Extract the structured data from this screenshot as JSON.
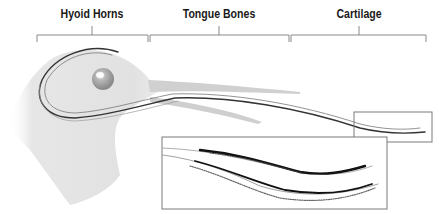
{
  "diagram": {
    "labels": [
      {
        "id": "hyoid-horns",
        "text": "Hyoid Horns",
        "x": 92,
        "bracket": [
          37,
          148
        ]
      },
      {
        "id": "tongue-bones",
        "text": "Tongue Bones",
        "x": 219,
        "bracket": [
          149,
          289
        ]
      },
      {
        "id": "cartilage",
        "text": "Cartilage",
        "x": 359,
        "bracket": [
          290,
          426
        ]
      }
    ],
    "inset_small": {
      "x": 354,
      "y": 112,
      "w": 78,
      "h": 30
    },
    "inset_large": {
      "x": 162,
      "y": 137,
      "w": 225,
      "h": 72
    },
    "colors": {
      "line": "#8a8a8a",
      "ink": "#222222",
      "feather": "#d6d6d6",
      "text": "#1a1a1a"
    }
  }
}
